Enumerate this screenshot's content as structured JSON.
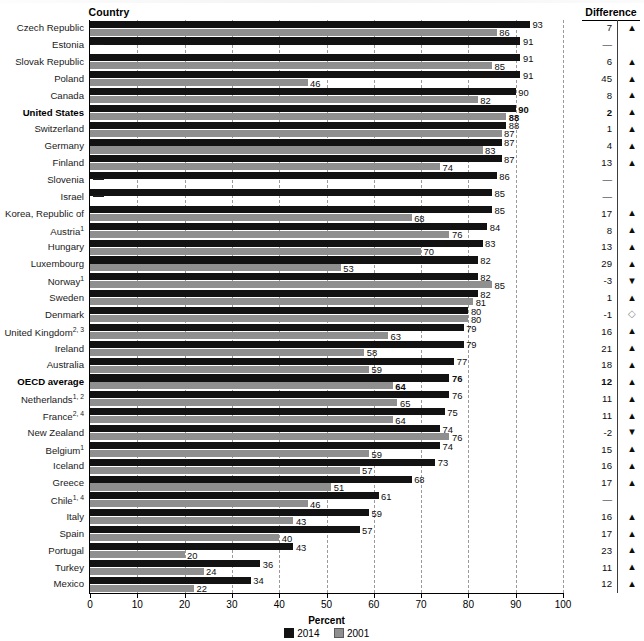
{
  "header": {
    "country_label": "Country",
    "difference_label": "Difference"
  },
  "axis": {
    "xlabel": "Percent",
    "ticks": [
      "0",
      "10",
      "20",
      "30",
      "40",
      "50",
      "60",
      "70",
      "80",
      "90",
      "100"
    ]
  },
  "legend": {
    "items": [
      {
        "label": "2014",
        "color": "#121212",
        "swatch": "dark"
      },
      {
        "label": "2001",
        "color": "#8f8f8f",
        "swatch": "gray"
      }
    ]
  },
  "symbols": {
    "up": "▲",
    "down": "▼",
    "nochange": "◇",
    "na": "—"
  },
  "chart_data": {
    "type": "bar",
    "orientation": "horizontal",
    "title": "",
    "xlabel": "Percent",
    "ylabel": "Country",
    "xlim": [
      0,
      100
    ],
    "grid": "vertical-dashed",
    "legend_position": "bottom-center",
    "categories": [
      "Czech Republic",
      "Estonia",
      "Slovak Republic",
      "Poland",
      "Canada",
      "United States",
      "Switzerland",
      "Germany",
      "Finland",
      "Slovenia",
      "Israel",
      "Korea, Republic of",
      "Austria",
      "Hungary",
      "Luxembourg",
      "Norway",
      "Sweden",
      "Denmark",
      "United Kingdom",
      "Ireland",
      "Australia",
      "OECD average",
      "Netherlands",
      "France",
      "New Zealand",
      "Belgium",
      "Iceland",
      "Greece",
      "Chile",
      "Italy",
      "Spain",
      "Portugal",
      "Turkey",
      "Mexico"
    ],
    "series": [
      {
        "name": "2014",
        "color": "#121212",
        "values": [
          93,
          91,
          91,
          91,
          90,
          90,
          88,
          87,
          87,
          86,
          85,
          85,
          84,
          83,
          82,
          82,
          82,
          80,
          79,
          79,
          77,
          76,
          76,
          75,
          74,
          74,
          73,
          68,
          61,
          59,
          57,
          43,
          36,
          34
        ]
      },
      {
        "name": "2001",
        "color": "#8f8f8f",
        "values": [
          86,
          null,
          85,
          46,
          82,
          88,
          87,
          83,
          74,
          null,
          null,
          68,
          76,
          70,
          53,
          85,
          81,
          80,
          63,
          58,
          59,
          64,
          65,
          64,
          76,
          59,
          57,
          51,
          46,
          43,
          40,
          20,
          24,
          22
        ]
      }
    ],
    "rows": [
      {
        "country": "Czech Republic",
        "footnotes": "",
        "bold": false,
        "v2014": 93,
        "v2001": 86,
        "difference": "7",
        "dir": "up"
      },
      {
        "country": "Estonia",
        "footnotes": "",
        "bold": false,
        "v2014": 91,
        "v2001": null,
        "difference": "—",
        "dir": "na"
      },
      {
        "country": "Slovak Republic",
        "footnotes": "",
        "bold": false,
        "v2014": 91,
        "v2001": 85,
        "difference": "6",
        "dir": "up"
      },
      {
        "country": "Poland",
        "footnotes": "",
        "bold": false,
        "v2014": 91,
        "v2001": 46,
        "difference": "45",
        "dir": "up"
      },
      {
        "country": "Canada",
        "footnotes": "",
        "bold": false,
        "v2014": 90,
        "v2001": 82,
        "difference": "8",
        "dir": "up"
      },
      {
        "country": "United States",
        "footnotes": "",
        "bold": true,
        "v2014": 90,
        "v2001": 88,
        "difference": "2",
        "dir": "up"
      },
      {
        "country": "Switzerland",
        "footnotes": "",
        "bold": false,
        "v2014": 88,
        "v2001": 87,
        "difference": "1",
        "dir": "up"
      },
      {
        "country": "Germany",
        "footnotes": "",
        "bold": false,
        "v2014": 87,
        "v2001": 83,
        "difference": "4",
        "dir": "up"
      },
      {
        "country": "Finland",
        "footnotes": "",
        "bold": false,
        "v2014": 87,
        "v2001": 74,
        "difference": "13",
        "dir": "up"
      },
      {
        "country": "Slovenia",
        "footnotes": "",
        "bold": false,
        "v2014": 86,
        "v2001": null,
        "difference": "—",
        "dir": "na"
      },
      {
        "country": "Israel",
        "footnotes": "",
        "bold": false,
        "v2014": 85,
        "v2001": null,
        "difference": "—",
        "dir": "na"
      },
      {
        "country": "Korea, Republic of",
        "footnotes": "",
        "bold": false,
        "v2014": 85,
        "v2001": 68,
        "difference": "17",
        "dir": "up"
      },
      {
        "country": "Austria",
        "footnotes": "1",
        "bold": false,
        "v2014": 84,
        "v2001": 76,
        "difference": "8",
        "dir": "up"
      },
      {
        "country": "Hungary",
        "footnotes": "",
        "bold": false,
        "v2014": 83,
        "v2001": 70,
        "difference": "13",
        "dir": "up"
      },
      {
        "country": "Luxembourg",
        "footnotes": "",
        "bold": false,
        "v2014": 82,
        "v2001": 53,
        "difference": "29",
        "dir": "up"
      },
      {
        "country": "Norway",
        "footnotes": "1",
        "bold": false,
        "v2014": 82,
        "v2001": 85,
        "difference": "-3",
        "dir": "down"
      },
      {
        "country": "Sweden",
        "footnotes": "",
        "bold": false,
        "v2014": 82,
        "v2001": 81,
        "difference": "1",
        "dir": "up"
      },
      {
        "country": "Denmark",
        "footnotes": "",
        "bold": false,
        "v2014": 80,
        "v2001": 80,
        "difference": "-1",
        "dir": "nochange"
      },
      {
        "country": "United Kingdom",
        "footnotes": "2, 3",
        "bold": false,
        "v2014": 79,
        "v2001": 63,
        "difference": "16",
        "dir": "up"
      },
      {
        "country": "Ireland",
        "footnotes": "",
        "bold": false,
        "v2014": 79,
        "v2001": 58,
        "difference": "21",
        "dir": "up"
      },
      {
        "country": "Australia",
        "footnotes": "",
        "bold": false,
        "v2014": 77,
        "v2001": 59,
        "difference": "18",
        "dir": "up"
      },
      {
        "country": "OECD average",
        "footnotes": "",
        "bold": true,
        "v2014": 76,
        "v2001": 64,
        "difference": "12",
        "dir": "up"
      },
      {
        "country": "Netherlands",
        "footnotes": "1, 2",
        "bold": false,
        "v2014": 76,
        "v2001": 65,
        "difference": "11",
        "dir": "up"
      },
      {
        "country": "France",
        "footnotes": "2, 4",
        "bold": false,
        "v2014": 75,
        "v2001": 64,
        "difference": "11",
        "dir": "up"
      },
      {
        "country": "New Zealand",
        "footnotes": "",
        "bold": false,
        "v2014": 74,
        "v2001": 76,
        "difference": "-2",
        "dir": "down"
      },
      {
        "country": "Belgium",
        "footnotes": "1",
        "bold": false,
        "v2014": 74,
        "v2001": 59,
        "difference": "15",
        "dir": "up"
      },
      {
        "country": "Iceland",
        "footnotes": "",
        "bold": false,
        "v2014": 73,
        "v2001": 57,
        "difference": "16",
        "dir": "up"
      },
      {
        "country": "Greece",
        "footnotes": "",
        "bold": false,
        "v2014": 68,
        "v2001": 51,
        "difference": "17",
        "dir": "up"
      },
      {
        "country": "Chile",
        "footnotes": "1, 4",
        "bold": false,
        "v2014": 61,
        "v2001": 46,
        "difference": "—",
        "dir": "na"
      },
      {
        "country": "Italy",
        "footnotes": "",
        "bold": false,
        "v2014": 59,
        "v2001": 43,
        "difference": "16",
        "dir": "up"
      },
      {
        "country": "Spain",
        "footnotes": "",
        "bold": false,
        "v2014": 57,
        "v2001": 40,
        "difference": "17",
        "dir": "up"
      },
      {
        "country": "Portugal",
        "footnotes": "",
        "bold": false,
        "v2014": 43,
        "v2001": 20,
        "difference": "23",
        "dir": "up"
      },
      {
        "country": "Turkey",
        "footnotes": "",
        "bold": false,
        "v2014": 36,
        "v2001": 24,
        "difference": "11",
        "dir": "up"
      },
      {
        "country": "Mexico",
        "footnotes": "",
        "bold": false,
        "v2014": 34,
        "v2001": 22,
        "difference": "12",
        "dir": "up"
      }
    ]
  }
}
